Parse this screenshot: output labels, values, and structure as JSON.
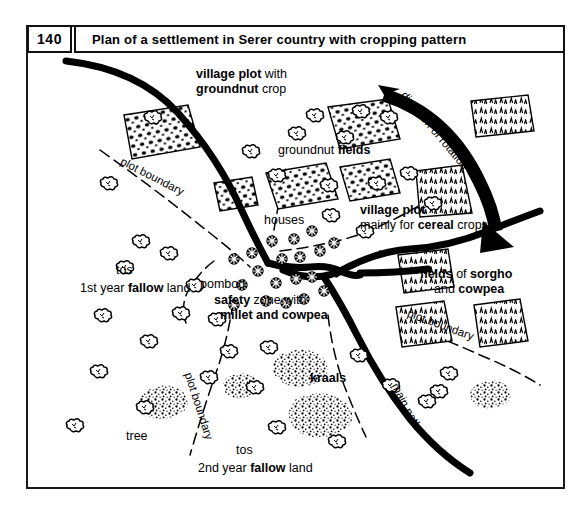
{
  "figure": {
    "number": "140",
    "title": "Plan of a settlement in Serer country with cropping pattern"
  },
  "labels": {
    "village_plot_groundnut_line1_bold": "village plot",
    "village_plot_groundnut_line1_rest": " with",
    "village_plot_groundnut_line2_bold": "groundnut",
    "village_plot_groundnut_line2_rest": " crop",
    "groundnut_fields_pre": "groundnut ",
    "groundnut_fields_bold": "fields",
    "direction_of_rotation": "direction of rotation",
    "village_plot_cereal_line1": "village plot",
    "village_plot_cereal_line2_pre": "mainly for ",
    "village_plot_cereal_line2_bold": "cereal",
    "village_plot_cereal_line2_post": " crops",
    "fields_of_sorgho_line1_bold1": "fields",
    "fields_of_sorgho_line1_mid": " of ",
    "fields_of_sorgho_line1_bold2": "sorgho",
    "fields_of_sorgho_line2_pre": "and ",
    "fields_of_sorgho_line2_bold": "cowpea",
    "houses": "houses",
    "pombod": "pombod",
    "safety_zone_line1_bold": "safety",
    "safety_zone_line1_rest": " zone with",
    "safety_zone_line2_bold": "millet and cowpea",
    "tos_first": "tos",
    "fallow_first_pre": "1st year ",
    "fallow_first_bold": "fallow",
    "fallow_first_post": " land",
    "tos_second": "tos",
    "fallow_second_pre": "2nd year ",
    "fallow_second_bold": "fallow",
    "fallow_second_post": " land",
    "kraals": "kraals",
    "tree": "tree",
    "main_path": "main path",
    "plot_boundary_upper_left": "plot boundary",
    "plot_boundary_lower_left": "plot boundary",
    "plot_boundary_right": "plot boundary"
  },
  "map_features": {
    "house_symbol": "hut-circle-icon",
    "tree_symbol": "tree-icon",
    "groundnut_field_pattern": "dotted-rows",
    "cereal_field_pattern": "sprout-ticks",
    "kraal_pattern": "stipple-blob",
    "main_path_style": "thick-solid-black",
    "plot_boundary_style": "thin-dashed-black",
    "rotation_arrow": "curved-black-arrow"
  },
  "colors": {
    "ink": "#000000",
    "paper": "#ffffff",
    "frame": "#1a1a1a"
  }
}
